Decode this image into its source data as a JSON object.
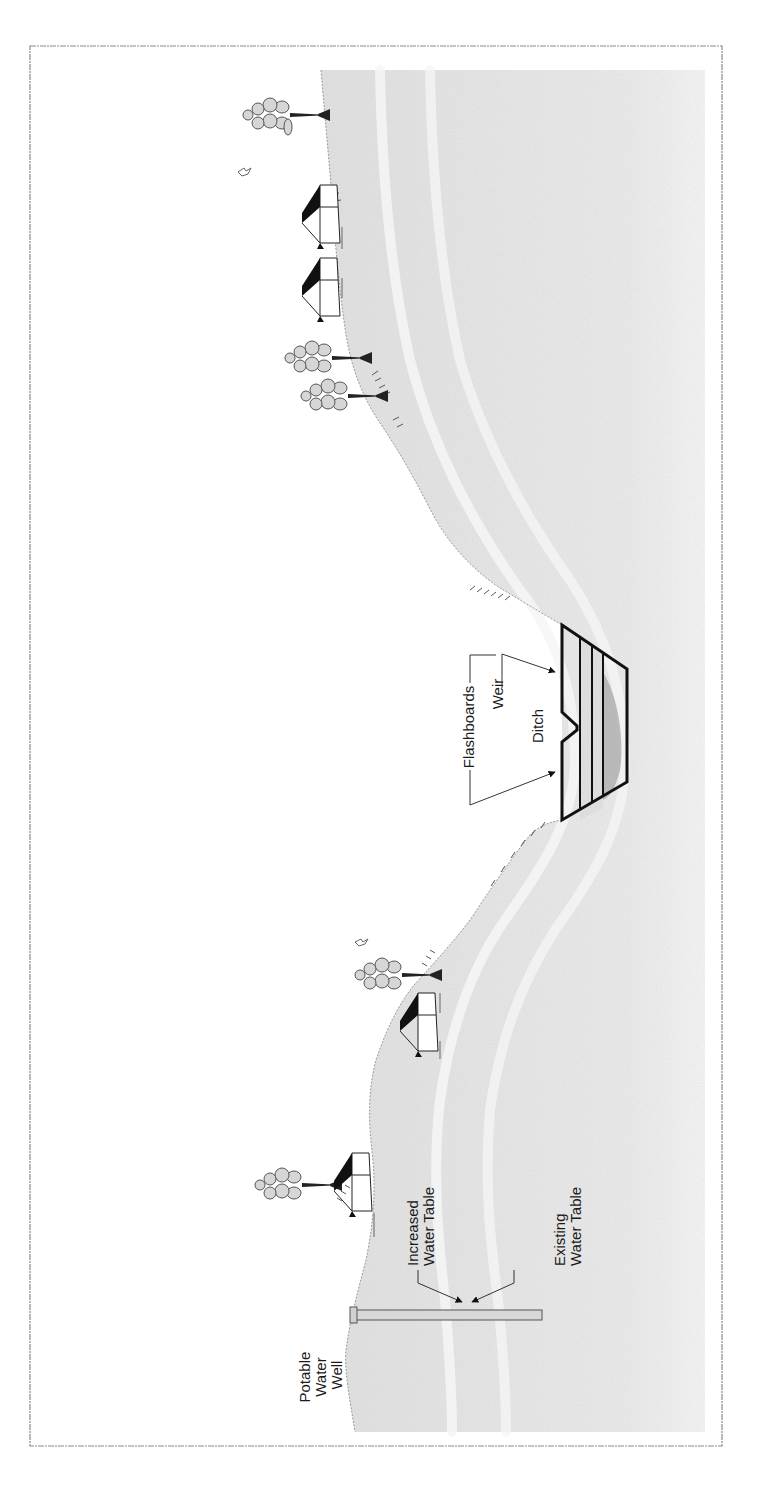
{
  "figure": {
    "orientation": "rotated-90-ccw",
    "frame_color": "#8a8a8a",
    "ground_color": "#e4e4e4",
    "ink_color": "#111111",
    "labels": {
      "well": [
        "Potable",
        "Water",
        "Well"
      ],
      "increased_water_table": [
        "Increased",
        "Water Table"
      ],
      "existing_water_table": [
        "Existing",
        "Water Table"
      ],
      "flashboards": "Flashboards",
      "weir": "Weir",
      "ditch": "Ditch"
    },
    "elements": {
      "houses": 4,
      "trees": 4,
      "birds": 2,
      "flashboard_count": 3
    }
  }
}
